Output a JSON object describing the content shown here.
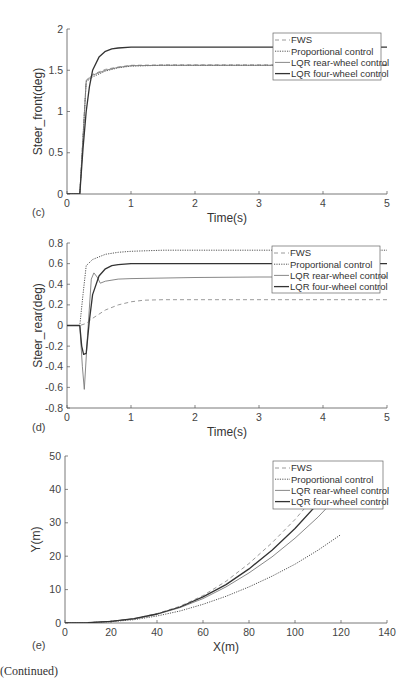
{
  "footer": {
    "continued": "(Continued)"
  },
  "legend_labels": [
    "FWS",
    "Proportional control",
    "LQR rear-wheel control",
    "LQR four-wheel control"
  ],
  "chart_data": [
    {
      "panel": "(c)",
      "type": "line",
      "title": "",
      "xlabel": "Time(s)",
      "ylabel": "Steer_front(deg)",
      "xlim": [
        0,
        5
      ],
      "ylim": [
        0,
        2
      ],
      "xticks": [
        0,
        1,
        2,
        3,
        4,
        5
      ],
      "yticks": [
        0,
        0.5,
        1,
        1.5,
        2
      ],
      "ytick_labels": [
        "0",
        "0.5",
        "1",
        "1.5",
        "2"
      ],
      "grid": false,
      "legend_position": "upper right",
      "series": [
        {
          "name": "FWS",
          "style": "dashed",
          "x": [
            0,
            0.2,
            0.3,
            0.4,
            0.6,
            0.8,
            1.0,
            1.5,
            2,
            3,
            4,
            5
          ],
          "y": [
            0,
            0,
            1.38,
            1.45,
            1.51,
            1.54,
            1.56,
            1.565,
            1.565,
            1.565,
            1.565,
            1.565
          ]
        },
        {
          "name": "Proportional control",
          "style": "dotted",
          "x": [
            0,
            0.2,
            0.3,
            0.4,
            0.6,
            0.8,
            1.0,
            1.5,
            2,
            3,
            4,
            5
          ],
          "y": [
            0,
            0,
            1.36,
            1.42,
            1.49,
            1.53,
            1.55,
            1.56,
            1.56,
            1.56,
            1.56,
            1.56
          ]
        },
        {
          "name": "LQR rear-wheel control",
          "style": "dashdot",
          "x": [
            0,
            0.2,
            0.3,
            0.4,
            0.6,
            0.8,
            1.0,
            1.5,
            2,
            3,
            4,
            5
          ],
          "y": [
            0,
            0,
            1.37,
            1.44,
            1.5,
            1.535,
            1.555,
            1.56,
            1.56,
            1.56,
            1.56,
            1.56
          ]
        },
        {
          "name": "LQR four-wheel control",
          "style": "solid",
          "x": [
            0,
            0.2,
            0.25,
            0.3,
            0.35,
            0.4,
            0.5,
            0.6,
            0.7,
            0.8,
            1.0,
            1.5,
            2,
            3,
            4,
            5
          ],
          "y": [
            0,
            0,
            0.55,
            1.0,
            1.3,
            1.5,
            1.66,
            1.73,
            1.76,
            1.77,
            1.78,
            1.78,
            1.78,
            1.78,
            1.78,
            1.78
          ]
        }
      ]
    },
    {
      "panel": "(d)",
      "type": "line",
      "title": "",
      "xlabel": "Time(s)",
      "ylabel": "Steer_rear(deg)",
      "xlim": [
        0,
        5
      ],
      "ylim": [
        -0.8,
        0.8
      ],
      "xticks": [
        0,
        1,
        2,
        3,
        4,
        5
      ],
      "yticks": [
        -0.8,
        -0.6,
        -0.4,
        -0.2,
        0,
        0.2,
        0.4,
        0.6,
        0.8
      ],
      "ytick_labels": [
        "-0.8",
        "-0.6",
        "-0.4",
        "-0.2",
        "0",
        "0.2",
        "0.4",
        "0.6",
        "0.8"
      ],
      "grid": false,
      "legend_position": "upper right",
      "series": [
        {
          "name": "FWS",
          "style": "dashed",
          "x": [
            0,
            0.2,
            0.3,
            0.4,
            0.6,
            0.8,
            1.0,
            1.2,
            1.5,
            2,
            3,
            4,
            5
          ],
          "y": [
            0,
            0,
            0.02,
            0.07,
            0.15,
            0.2,
            0.23,
            0.245,
            0.25,
            0.25,
            0.25,
            0.25,
            0.25
          ]
        },
        {
          "name": "Proportional control",
          "style": "dotted",
          "x": [
            0,
            0.2,
            0.25,
            0.3,
            0.4,
            0.6,
            0.8,
            1.0,
            1.5,
            2,
            3,
            4,
            5
          ],
          "y": [
            0,
            0,
            0.3,
            0.58,
            0.64,
            0.69,
            0.71,
            0.72,
            0.73,
            0.73,
            0.73,
            0.73,
            0.73
          ]
        },
        {
          "name": "LQR rear-wheel control",
          "style": "dashdot",
          "x": [
            0,
            0.2,
            0.24,
            0.27,
            0.32,
            0.38,
            0.42,
            0.47,
            0.52,
            0.6,
            0.8,
            1.0,
            2,
            3,
            4,
            5
          ],
          "y": [
            0,
            0,
            -0.4,
            -0.62,
            -0.1,
            0.45,
            0.51,
            0.47,
            0.41,
            0.43,
            0.45,
            0.455,
            0.465,
            0.47,
            0.47,
            0.47
          ]
        },
        {
          "name": "LQR four-wheel control",
          "style": "solid",
          "x": [
            0,
            0.2,
            0.23,
            0.26,
            0.3,
            0.35,
            0.4,
            0.5,
            0.6,
            0.7,
            0.8,
            1.0,
            1.5,
            2,
            3,
            4,
            5
          ],
          "y": [
            0,
            0,
            -0.2,
            -0.28,
            -0.27,
            0.05,
            0.3,
            0.48,
            0.55,
            0.58,
            0.59,
            0.6,
            0.6,
            0.6,
            0.6,
            0.6,
            0.6
          ]
        }
      ]
    },
    {
      "panel": "(e)",
      "type": "line",
      "title": "",
      "xlabel": "X(m)",
      "ylabel": "Y(m)",
      "xlim": [
        0,
        140
      ],
      "ylim": [
        0,
        50
      ],
      "xticks": [
        0,
        20,
        40,
        60,
        80,
        100,
        120,
        140
      ],
      "yticks": [
        0,
        10,
        20,
        30,
        40,
        50
      ],
      "ytick_labels": [
        "0",
        "10",
        "20",
        "30",
        "40",
        "50"
      ],
      "grid": false,
      "legend_position": "upper right",
      "series": [
        {
          "name": "FWS",
          "style": "dashed",
          "x": [
            0,
            10,
            20,
            30,
            40,
            50,
            60,
            70,
            80,
            90,
            100,
            110
          ],
          "y": [
            0,
            0.1,
            0.5,
            1.3,
            2.8,
            5.0,
            8.2,
            12.5,
            17.8,
            24.0,
            31.0,
            39.0
          ]
        },
        {
          "name": "Proportional control",
          "style": "dotted",
          "x": [
            0,
            10,
            20,
            30,
            40,
            50,
            60,
            70,
            80,
            90,
            100,
            110,
            120
          ],
          "y": [
            0,
            0.1,
            0.4,
            1.0,
            2.1,
            3.6,
            5.6,
            8.0,
            10.8,
            14.0,
            17.6,
            21.8,
            26.5
          ]
        },
        {
          "name": "LQR rear-wheel control",
          "style": "dashdot",
          "x": [
            0,
            10,
            20,
            30,
            40,
            50,
            60,
            70,
            80,
            90,
            100,
            110,
            118
          ],
          "y": [
            0,
            0.1,
            0.5,
            1.2,
            2.6,
            4.6,
            7.3,
            10.8,
            15.0,
            19.8,
            25.4,
            31.7,
            37.5
          ]
        },
        {
          "name": "LQR four-wheel control",
          "style": "solid",
          "x": [
            0,
            10,
            20,
            30,
            40,
            50,
            60,
            70,
            80,
            90,
            100,
            110,
            113
          ],
          "y": [
            0,
            0.1,
            0.5,
            1.3,
            2.7,
            4.8,
            7.8,
            11.5,
            16.2,
            21.8,
            28.3,
            35.8,
            38.5
          ]
        }
      ]
    }
  ]
}
